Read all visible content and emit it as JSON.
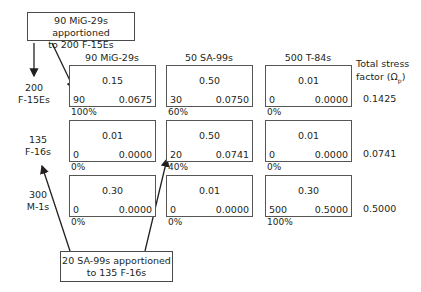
{
  "callouts": {
    "top": [
      "90 MiG-29s apportioned",
      "to 200 F-15Es"
    ],
    "bottom": [
      "20 SA-99s apportioned",
      "to 135 F-16s"
    ]
  },
  "columns": [
    "90 MiG-29s",
    "50 SA-99s",
    "500 T-84s"
  ],
  "total_header": [
    "Total stress",
    "factor (Ω",
    "p",
    ")"
  ],
  "rows": [
    {
      "label": [
        "200",
        "F-15Es"
      ],
      "cells": [
        {
          "value": "0.15",
          "count": "90",
          "stress": "0.0675",
          "percent": "100%"
        },
        {
          "value": "0.50",
          "count": "30",
          "stress": "0.0750",
          "percent": "60%"
        },
        {
          "value": "0.01",
          "count": "0",
          "stress": "0.0000",
          "percent": "0%"
        }
      ],
      "total": "0.1425"
    },
    {
      "label": [
        "135",
        "F-16s"
      ],
      "cells": [
        {
          "value": "0.01",
          "count": "0",
          "stress": "0.0000",
          "percent": "0%"
        },
        {
          "value": "0.50",
          "count": "20",
          "stress": "0.0741",
          "percent": "40%"
        },
        {
          "value": "0.01",
          "count": "0",
          "stress": "0.0000",
          "percent": "0%"
        }
      ],
      "total": "0.0741"
    },
    {
      "label": [
        "300",
        "M-1s"
      ],
      "cells": [
        {
          "value": "0.30",
          "count": "0",
          "stress": "0.0000",
          "percent": "0%"
        },
        {
          "value": "0.01",
          "count": "0",
          "stress": "0.0000",
          "percent": "0%"
        },
        {
          "value": "0.30",
          "count": "500",
          "stress": "0.5000",
          "percent": "100%"
        }
      ],
      "total": "0.5000"
    }
  ]
}
